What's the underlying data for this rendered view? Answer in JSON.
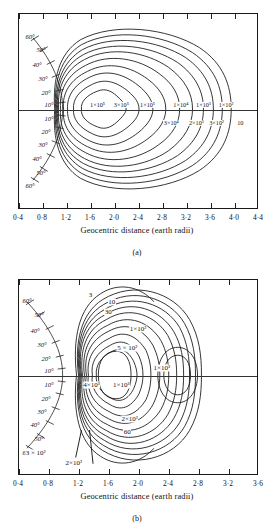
{
  "figure": {
    "axis_title": "Geocentric distance (earth radii)",
    "panel_a_letter": "(a)",
    "panel_b_letter": "(b)"
  },
  "panel_a": {
    "xticks": [
      "0·4",
      "0·8",
      "1·2",
      "1·6",
      "2·0",
      "2·4",
      "2·8",
      "3·2",
      "3·6",
      "4·0",
      "4·4"
    ],
    "xmin": 0.4,
    "xmax": 4.4,
    "lat_labels_north": [
      "60°",
      "50°",
      "40°",
      "30°",
      "20°",
      "10°"
    ],
    "lat_labels_south": [
      "10°",
      "20°",
      "30°",
      "40°",
      "50°",
      "60°"
    ],
    "contour_labels": [
      {
        "text": "1×10⁵",
        "x": 0.33,
        "y": 0.47
      },
      {
        "text": "3×10⁵",
        "x": 0.43,
        "y": 0.47
      },
      {
        "text": "1×10⁵",
        "x": 0.54,
        "y": 0.47
      },
      {
        "text": "1×10⁴",
        "x": 0.68,
        "y": 0.47
      },
      {
        "text": "1×10³",
        "x": 0.775,
        "y": 0.47
      },
      {
        "text": "1×10²",
        "x": 0.87,
        "y": 0.47
      },
      {
        "text": "3×10⁴",
        "x": 0.64,
        "y": 0.56
      },
      {
        "text": "2×10³",
        "x": 0.745,
        "y": 0.56
      },
      {
        "text": "3×10²",
        "x": 0.83,
        "y": 0.56
      },
      {
        "text": "10",
        "x": 0.93,
        "y": 0.56
      }
    ]
  },
  "panel_b": {
    "xticks": [
      "0·4",
      "0·8",
      "1·2",
      "1·6",
      "2·0",
      "2·4",
      "2·8",
      "3·2",
      "3·6"
    ],
    "xmin": 0.4,
    "xmax": 3.6,
    "lat_labels_north": [
      "60°",
      "50°",
      "40°",
      "30°",
      "20°",
      "10°"
    ],
    "lat_labels_south": [
      "10°",
      "20°",
      "30°",
      "40°",
      "50°",
      "60°"
    ],
    "contour_labels": [
      {
        "text": "3",
        "x": 0.3,
        "y": 0.075
      },
      {
        "text": "10",
        "x": 0.39,
        "y": 0.115
      },
      {
        "text": "30",
        "x": 0.375,
        "y": 0.165
      },
      {
        "text": "1×10²",
        "x": 0.5,
        "y": 0.25
      },
      {
        "text": "5 × 10²",
        "x": 0.455,
        "y": 0.35
      },
      {
        "text": "1×10³",
        "x": 0.6,
        "y": 0.455
      },
      {
        "text": "4×10³",
        "x": 0.305,
        "y": 0.54
      },
      {
        "text": "1×10³",
        "x": 0.43,
        "y": 0.54
      },
      {
        "text": "2×10²",
        "x": 0.465,
        "y": 0.715
      },
      {
        "text": "60",
        "x": 0.455,
        "y": 0.785
      },
      {
        "text": "3 × 10²",
        "x": 0.07,
        "y": 0.89
      },
      {
        "text": "2×10²",
        "x": 0.23,
        "y": 0.945
      }
    ]
  },
  "chart_data": {
    "type": "line",
    "xlabel": "Geocentric distance (earth radii)",
    "ylabel": "Geomagnetic latitude (degrees)",
    "panels": [
      {
        "label": "(a)",
        "xlim": [
          0.4,
          4.4
        ],
        "xticks": [
          0.4,
          0.8,
          1.2,
          1.6,
          2.0,
          2.4,
          2.8,
          3.2,
          3.6,
          4.0,
          4.4
        ],
        "latitude_ticks": [
          60,
          50,
          40,
          30,
          20,
          10,
          0,
          -10,
          -20,
          -30,
          -40,
          -50,
          -60
        ],
        "grid": false,
        "legend": "none",
        "contour_levels": [
          {
            "value": 100000.0,
            "label": "1×10⁵"
          },
          {
            "value": 300000.0,
            "label": "3×10⁵"
          },
          {
            "value": 100000.0,
            "label": "1×10⁵"
          },
          {
            "value": 30000.0,
            "label": "3×10⁴"
          },
          {
            "value": 10000.0,
            "label": "1×10⁴"
          },
          {
            "value": 2000.0,
            "label": "2×10³"
          },
          {
            "value": 1000.0,
            "label": "1×10³"
          },
          {
            "value": 300.0,
            "label": "3×10²"
          },
          {
            "value": 100.0,
            "label": "1×10²"
          },
          {
            "value": 10,
            "label": "10"
          }
        ]
      },
      {
        "label": "(b)",
        "xlim": [
          0.4,
          3.6
        ],
        "xticks": [
          0.4,
          0.8,
          1.2,
          1.6,
          2.0,
          2.4,
          2.8,
          3.2,
          3.6
        ],
        "latitude_ticks": [
          60,
          50,
          40,
          30,
          20,
          10,
          0,
          -10,
          -20,
          -30,
          -40,
          -50,
          -60
        ],
        "grid": false,
        "legend": "none",
        "contour_levels": [
          {
            "value": 3,
            "label": "3"
          },
          {
            "value": 10,
            "label": "10"
          },
          {
            "value": 30,
            "label": "30"
          },
          {
            "value": 60,
            "label": "60"
          },
          {
            "value": 100.0,
            "label": "1×10²"
          },
          {
            "value": 200.0,
            "label": "2×10²"
          },
          {
            "value": 300.0,
            "label": "3 × 10²"
          },
          {
            "value": 500.0,
            "label": "5 × 10²"
          },
          {
            "value": 1000.0,
            "label": "1×10³"
          },
          {
            "value": 4000.0,
            "label": "4×10³"
          }
        ]
      }
    ]
  }
}
